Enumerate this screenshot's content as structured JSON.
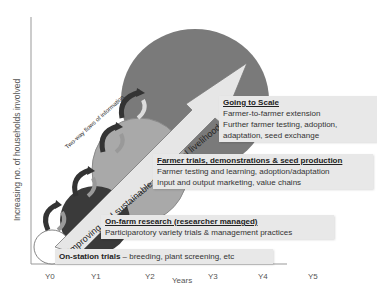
{
  "diagram": {
    "y_axis_label": "Increasing no. of households involved",
    "x_axis_label": "Years",
    "x_ticks": [
      "Y0",
      "Y1",
      "Y2",
      "Y3",
      "Y4",
      "Y5"
    ],
    "arrow_label": "Improving and sustainable agricultural livelihoods",
    "side_label": "Two-way flows of information",
    "stages": [
      {
        "title": "On-station trials",
        "separator": " – ",
        "lines": [
          "breeding, plant screening, etc"
        ]
      },
      {
        "title": "On-farm research (researcher managed)",
        "lines": [
          "Participarotory variety trials  & management practices"
        ]
      },
      {
        "title": "Farmer trials, demonstrations & seed production",
        "lines": [
          "Farmer testing and learning, adoption/adaptation",
          "Input and output marketing, value chains"
        ]
      },
      {
        "title": "Going to Scale",
        "lines": [
          "Farmer-to-farmer extension",
          "Further farmer testing, adoption,",
          "adaptation, seed exchange"
        ]
      }
    ],
    "colors": {
      "circle_large": "#7a7a7a",
      "circle_medium": "#a9a9a9",
      "circle_small": "#3a3a3a",
      "circle_tiny": "#ffffff",
      "arrow_fill": "#e6e6e6",
      "box_fill": "#e8e8e8",
      "axis": "#888888"
    }
  }
}
